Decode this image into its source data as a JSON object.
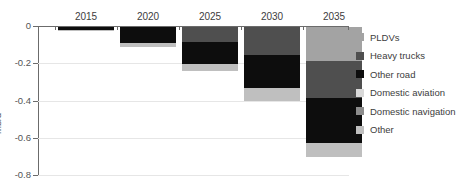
{
  "chart_title": "",
  "axis": {
    "y_label": "mb/d",
    "y_ticks": [
      "0",
      "-0.2",
      "-0.4",
      "-0.6",
      "-0.8"
    ],
    "y_min": -0.8,
    "y_max": 0.0
  },
  "legend": {
    "items": [
      {
        "label": "PLDVs",
        "color": "#a3a3a3"
      },
      {
        "label": "Heavy trucks",
        "color": "#4f4f4f"
      },
      {
        "label": "Other road",
        "color": "#0d0d0d"
      },
      {
        "label": "Domestic aviation",
        "color": "#d9d9d9"
      },
      {
        "label": "Domestic navigation",
        "color": "#8c8c8c"
      },
      {
        "label": "Other",
        "color": "#bfbfbf"
      }
    ]
  },
  "chart_data": {
    "type": "bar",
    "stacked": true,
    "title": "",
    "xlabel": "",
    "ylabel": "mb/d",
    "ylim": [
      -0.8,
      0.0
    ],
    "grid": true,
    "legend_position": "right",
    "categories": [
      "2015",
      "2020",
      "2025",
      "2030",
      "2035"
    ],
    "series": [
      {
        "name": "PLDVs",
        "color": "#a3a3a3",
        "values": [
          0.0,
          0.0,
          0.0,
          0.0,
          -0.18
        ]
      },
      {
        "name": "Heavy trucks",
        "color": "#4f4f4f",
        "values": [
          0.0,
          0.0,
          -0.08,
          -0.15,
          -0.2
        ]
      },
      {
        "name": "Other road",
        "color": "#0d0d0d",
        "values": [
          -0.018,
          -0.085,
          -0.12,
          -0.18,
          -0.245
        ]
      },
      {
        "name": "Domestic aviation",
        "color": "#d9d9d9",
        "values": [
          0.0,
          0.0,
          0.0,
          0.0,
          0.0
        ]
      },
      {
        "name": "Domestic navigation",
        "color": "#8c8c8c",
        "values": [
          0.0,
          0.0,
          0.0,
          0.0,
          0.0
        ]
      },
      {
        "name": "Other",
        "color": "#bfbfbf",
        "values": [
          -0.002,
          -0.02,
          -0.035,
          -0.065,
          -0.075
        ]
      }
    ],
    "totals": [
      -0.02,
      -0.105,
      -0.235,
      -0.395,
      -0.7
    ]
  },
  "layout": {
    "plot_left": 38,
    "plot_top": 26,
    "plot_width": 311,
    "plot_height": 149,
    "bar_width": 56,
    "category_centers": [
      48,
      110,
      172,
      234,
      296
    ]
  }
}
